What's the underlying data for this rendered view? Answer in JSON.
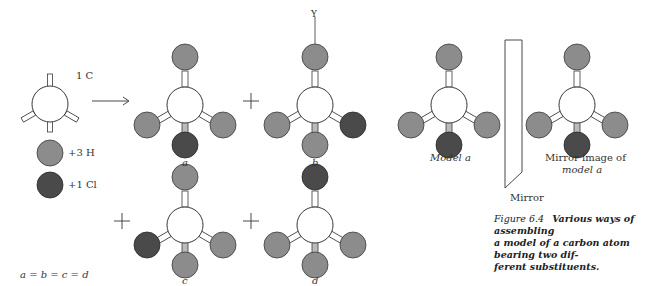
{
  "figure": {
    "number": "Figure 6.4",
    "caption": "Various ways of assembling a model of a carbon atom bearing two different substituents.",
    "caption_lines": [
      "Various ways of assembling",
      "a model of a carbon atom bearing two dif-",
      "ferent substituents."
    ]
  },
  "legend": {
    "carbon_label": "1 C",
    "hydrogen_label": "+3 H",
    "chlorine_label": "+1 Cl"
  },
  "models": {
    "a": {
      "label": "a",
      "top": "H",
      "left": "H",
      "right": "H",
      "bottom": "Cl"
    },
    "b": {
      "label": "b",
      "top": "H",
      "left": "H",
      "right": "Cl",
      "bottom": "H",
      "axis_label": "Y"
    },
    "c": {
      "label": "c",
      "top": "H",
      "left": "Cl",
      "right": "H",
      "bottom": "H"
    },
    "d": {
      "label": "d",
      "top": "Cl",
      "left": "H",
      "right": "H",
      "bottom": "H"
    }
  },
  "operators": {
    "arrow": "→",
    "plus": "+"
  },
  "equality": "a = b = c = d",
  "mirror": {
    "label": "Mirror",
    "left_model_label": "Model a",
    "right_model_label_line1": "Mirror image of",
    "right_model_label_line2": "model a"
  },
  "colors": {
    "hydrogen": "#8c8c8c",
    "chlorine": "#4a4a4a",
    "carbon": "#ffffff",
    "outline": "#3a3a3a"
  }
}
